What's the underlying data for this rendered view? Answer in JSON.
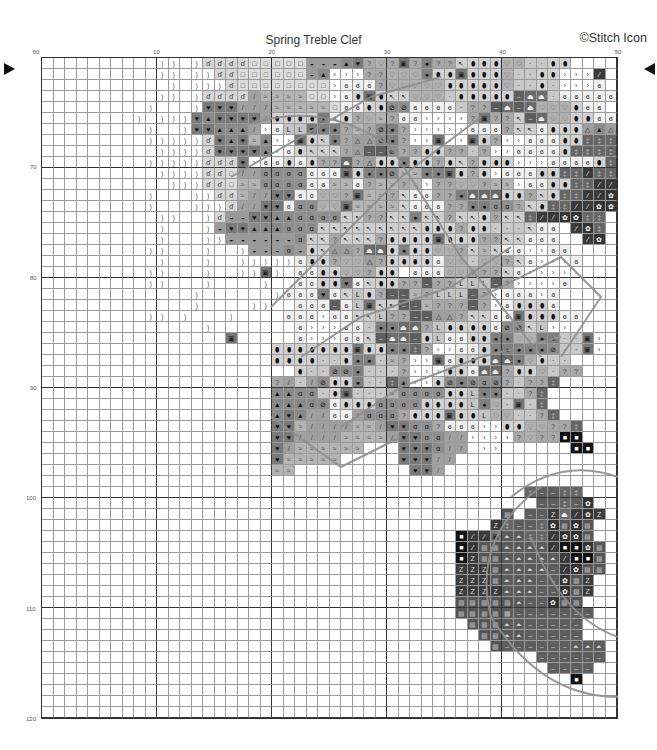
{
  "header": {
    "title": "Spring Treble Clef",
    "copyright": "©Stitch Icon"
  },
  "axes": {
    "column_labels": [
      {
        "label": "60",
        "col": -1
      },
      {
        "label": "10",
        "col": 10
      },
      {
        "label": "20",
        "col": 20
      },
      {
        "label": "30",
        "col": 30
      },
      {
        "label": "40",
        "col": 40
      },
      {
        "label": "50",
        "col": 50
      }
    ],
    "row_labels": [
      {
        "label": "70",
        "row": 10
      },
      {
        "label": "80",
        "row": 20
      },
      {
        "label": "90",
        "row": 30
      },
      {
        "label": "100",
        "row": 40
      },
      {
        "label": "110",
        "row": 50
      },
      {
        "label": "120",
        "row": 60
      }
    ],
    "center_markers": {
      "row": 2
    }
  },
  "grid": {
    "cols": 50,
    "rows": 60,
    "legend": {
      ".": {
        "name": "empty",
        "bg": "#ffffff",
        "glyph": "",
        "fg": "#222"
      },
      ")": {
        "name": "paren",
        "bg": "#ffffff",
        "glyph": ")",
        "fg": "#555"
      },
      "d": {
        "name": "note",
        "bg": "#d6d6d6",
        "glyph": "ɗ",
        "fg": "#333"
      },
      "o": {
        "name": "small-square",
        "bg": "#dcdcdc",
        "glyph": "□",
        "fg": "#333"
      },
      "u": {
        "name": "bowl",
        "bg": "#9a9a9a",
        "glyph": "◒",
        "fg": "#111"
      },
      "^": {
        "name": "triangle",
        "bg": "#8a8a8a",
        "glyph": "▲",
        "fg": "#111"
      },
      "h": {
        "name": "heart",
        "bg": "#7a7a7a",
        "glyph": "♥",
        "fg": "#111"
      },
      "?": {
        "name": "question",
        "bg": "#a8a8a8",
        "glyph": "?",
        "fg": "#444"
      },
      "v": {
        "name": "open-heart",
        "bg": "#b0b0b0",
        "glyph": "♡",
        "fg": "#555"
      },
      "b": {
        "name": "dot",
        "bg": "#808080",
        "glyph": "●",
        "fg": "#111"
      },
      "i": {
        "name": "bean",
        "bg": "#d2d2d2",
        "glyph": "⬮",
        "fg": "#111"
      },
      ":": {
        "name": "small-dot",
        "bg": "#c8c8c8",
        "glyph": "·",
        "fg": "#222"
      },
      ">": {
        "name": "chevron",
        "bg": "#ffffff",
        "glyph": "›",
        "fg": "#333"
      },
      "g": {
        "name": "swirl",
        "bg": "#f0f0f0",
        "glyph": "ɞ",
        "fg": "#222"
      },
      "#": {
        "name": "boxed-square",
        "bg": "#777777",
        "glyph": "▣",
        "fg": "#222"
      },
      "/": {
        "name": "slash",
        "bg": "#a0a0a0",
        "glyph": "/",
        "fg": "#444"
      },
      "w": {
        "name": "wave",
        "bg": "#b4b4b4",
        "glyph": "≈",
        "fg": "#444"
      },
      "k": {
        "name": "key",
        "bg": "#cfcfcf",
        "glyph": "↖",
        "fg": "#222"
      },
      "L": {
        "name": "ell",
        "bg": "#c4c4c4",
        "glyph": "L",
        "fg": "#111"
      },
      "s": {
        "name": "slash-circle",
        "bg": "#8c8c8c",
        "glyph": "⊘",
        "fg": "#111"
      },
      "q": {
        "name": "filled-note",
        "bg": "#8e8e8e",
        "glyph": "ɑ",
        "fg": "#111"
      },
      "A": {
        "name": "outline-triangle",
        "bg": "#9e9e9e",
        "glyph": "△",
        "fg": "#222"
      },
      "-": {
        "name": "dash",
        "bg": "#5e5e5e",
        "glyph": "–",
        "fg": "#ccc"
      },
      "c": {
        "name": "cup",
        "bg": "#6a6a6a",
        "glyph": "⏏",
        "fg": "#fff"
      },
      "z": {
        "name": "zed",
        "bg": "#3c3c3c",
        "glyph": "Z",
        "fg": "#ddd"
      },
      "e": {
        "name": "crosshatch",
        "bg": "#5a5a5a",
        "glyph": "▦",
        "fg": "#bbb"
      },
      "x": {
        "name": "checker",
        "bg": "#555555",
        "glyph": "▩",
        "fg": "#aaa"
      },
      "*": {
        "name": "flower",
        "bg": "#333333",
        "glyph": "✿",
        "fg": "#fff"
      },
      "p": {
        "name": "pill",
        "bg": "#3a3a3a",
        "glyph": "⁄",
        "fg": "#fff"
      },
      "m": {
        "name": "mountain",
        "bg": "#5c5c5c",
        "glyph": "⏶",
        "fg": "#ddd"
      },
      "=": {
        "name": "double-dagger",
        "bg": "#666666",
        "glyph": "‡",
        "fg": "#bbb"
      },
      "B": {
        "name": "black-white-square",
        "bg": "#111111",
        "glyph": "■",
        "fg": "#fff"
      }
    },
    "rows_data": [
      "..........)).)ddddooooouuu^h?v?#?b??kiiivv::ii...",
      "..........)).))ddoooooou^>>>??vvvbii#iiiv::ii>>>p",
      "...........).)))doooooooo>ggg?vvvvviiiiiv::i:>>>g",
      "..........)).)dddd/wwwwoo>gi#ikkvvv:iiiii-cc:ggggg",
      ".........)...)hhh///wwwwwoggiissgggg:??-c-cvvvigg",
      "........).)))h^hhhh/iiiihgi?vw?gg>>>>?#??k-cvviigg",
      ".........)..)hh^^^/>gLLhbb?w?sb?>>>>>ggg?kkgiiiA^A",
      ".........)))))dh^hw^>>#ikb?AAsb?>>#>>#i?>>gggii===",
      "..........))))dhhhh^>gikkk?A--s??ii??:?>>ggggi====",
      ".........)))))dddh>ggigi??c?Aiibii?ik?iii>>>ggggi==",
      "..........))))ddo//qqqqggg#ibbswwbb#i?i>gggii==p==",
      "...........)))ddowwqqqqggwwg?ww?w>??vv?ww>ggii==pp",
      ".........)...))ddw//hhggvv?#ww?kgg??bcccii?ki==pp*",
      ".........)...)))d//hhgqqvv#wwwwkggg??bbqq?ki==pp**",
      "..........))..)duuhh^^qqqqkk??kkbkk?kki?kk=pp**==",
      "..........)...)uhh^^^qqqkkkkkkkkkiii?ii:::kgg.p*=",
      "..........)...))uuuuuuqkk?kkk?iiii#iii??kkggg..p*",
      ".........))...)..)uuuquikAA?ccibiivv?kwkgg>>gg...",
      "..........)...)..)))))gii?vvA?iiiigvv:vv?kg>>>g..",
      ".........))...)..))#).ggiivv?ii.gggvv???kg>>>>>..",
      ".........))...)....)..ggiihgkii??-??LLL-?>>>>g...",
      ".............)......)ggghgkLi?--w?LLL-?>ggg>g....",
      ".............)....))..ggg-gL#kk--w???-?>giiig....",
      ".........)).)...)....ggg>ggkkL??--AA?kkgg#iiigg..",
      "..............).......g>>>gg:bbcc?LiiiigsskL>>...",
      "................#.....g>>>ggk-cc-iLggiibbvvbb::#>",
      "....................iiiiiii#iibb=?>>ggibbbbbs::#>",
      "....................iiii::ibb:w?>>#giiiccbvi::...",
      "......................i::ssb:::?>>>iigcc?iiv:??..",
      "....................?/:/siib::=^>>isbsqs?:??=...",
      "....................^^qq:i#:::wqqqqiiLbb::?=....",
      "....................^^^qsgiiiqqqqiiiiLbv:#:=....",
      "....................^h^//gg/qqq?iii#iiLvv::?=...",
      "....................hhw////ww/hhqq?ggg>>iivv??=..",
      "....................hh////wwww/hhqq//>>>>?v??BB..",
      "....................h/wwwwww...hhhq//.>>......BB.",
      "....................hwwwww.....hhh//............",
      "....................ww..........hh/.............",
      "................................................",
      "..........................................=--==.",
      "...........................................--=-*.",
      "........................................x.--zcp*z",
      ".......................................z=--=*x*x.",
      "....................................Bpp#mm==p**x.",
      "....................................BpxxmmmmpBB*x",
      "....................................BzxxmmmmmpBBx",
      "....................................zzzxmmmm-p*xx",
      "....................................zzzxmmm--*xz.",
      "....................................zzzzmmm--*xz.",
      "....................................xxxxxm--*xx..",
      "....................................xxxxe-------..",
      ".....................................xxxmm-----..",
      "......................................xxmm-----...",
      ".......................................x------mmm.",
      "...........................................------.",
      "............................................----.",
      "..............................................B..",
      "..................................................",
      "..................................................",
      ".................................................."
    ]
  }
}
